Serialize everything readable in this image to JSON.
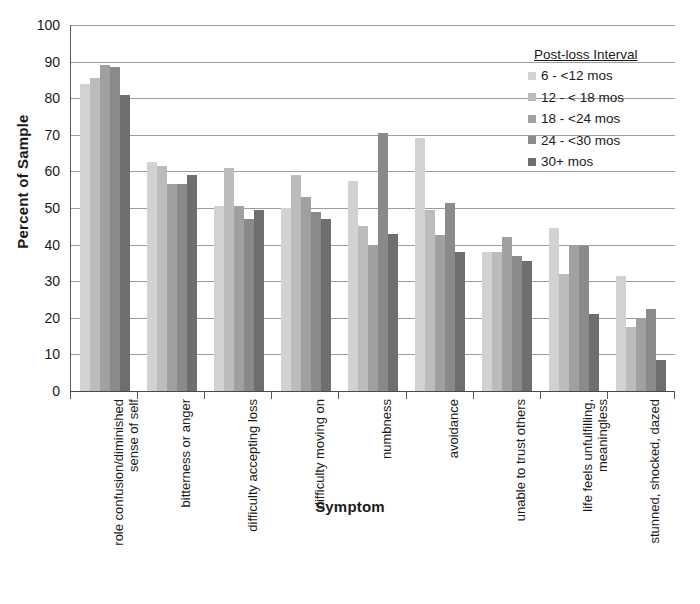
{
  "chart_data": {
    "type": "bar",
    "title": "",
    "xlabel": "Symptom",
    "ylabel": "Percent of Sample",
    "ylim": [
      0,
      100
    ],
    "ytick_step": 10,
    "yticks": [
      0,
      10,
      20,
      30,
      40,
      50,
      60,
      70,
      80,
      90,
      100
    ],
    "ytick_labels": [
      "0",
      "10",
      "20",
      "30",
      "40",
      "50",
      "60",
      "70",
      "80",
      "90",
      "100"
    ],
    "grid": "horizontal",
    "legend_position": "top-right",
    "legend_title": "Post-loss Interval",
    "categories": [
      "role confusion/diminished sense of self",
      "bitterness or anger",
      "difficulty accepting loss",
      "difficulty moving on",
      "numbness",
      "avoidance",
      "unable to trust others",
      "life feels unfulfilling, meaningless",
      "stunned, shocked, dazed"
    ],
    "series": [
      {
        "name": "6 - <12 mos",
        "color": "#d2d2d2",
        "values": [
          84,
          62.5,
          50.5,
          50,
          57.5,
          69,
          38,
          44.5,
          31.5
        ]
      },
      {
        "name": "12 - < 18 mos",
        "color": "#bcbcbc",
        "values": [
          85.5,
          61.5,
          61,
          59,
          45,
          49.5,
          38,
          32,
          17.5
        ]
      },
      {
        "name": "18 - <24 mos",
        "color": "#a0a0a0",
        "values": [
          89,
          56.5,
          50.5,
          53,
          40,
          42.5,
          42,
          39.5,
          20
        ]
      },
      {
        "name": "24 - <30 mos",
        "color": "#8a8a8a",
        "values": [
          88.5,
          56.5,
          47,
          49,
          70.5,
          51.5,
          37,
          39.5,
          22.5
        ]
      },
      {
        "name": "30+ mos",
        "color": "#6e6e6e",
        "values": [
          81,
          59,
          49.5,
          47,
          43,
          38,
          35.5,
          21,
          8.5
        ]
      }
    ]
  },
  "colors": {
    "gridline": "#9d9d9d",
    "axis": "#5a5a5a",
    "text": "#1a1a1a",
    "background": "#ffffff"
  }
}
